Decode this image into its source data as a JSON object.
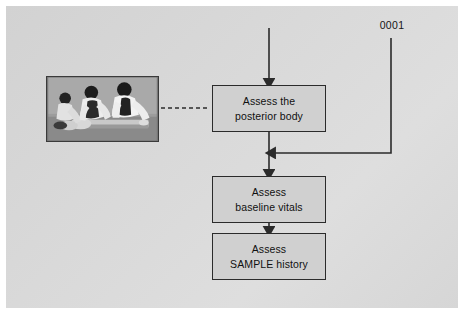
{
  "figure": {
    "background_color": "#d6d6d6",
    "frame_color": "#ffffff"
  },
  "callout": {
    "number": "0001"
  },
  "flow": {
    "boxes": [
      {
        "id": "posterior",
        "label": "Assess the\nposterior body",
        "line1": "Assess the",
        "line2": "posterior body"
      },
      {
        "id": "vitals",
        "label": "Assess\nbaseline vitals",
        "line1": "Assess",
        "line2": "baseline vitals"
      },
      {
        "id": "sample",
        "label": "Assess\nSAMPLE history",
        "line1": "Assess",
        "line2": "SAMPLE history"
      }
    ],
    "box_fill": "#d0d0d0",
    "box_stroke": "#2b2b2b",
    "connector_color": "#2b2b2b"
  },
  "photo": {
    "alt": "Three rescuers log-rolling a patient to assess the posterior body",
    "caption": ""
  }
}
